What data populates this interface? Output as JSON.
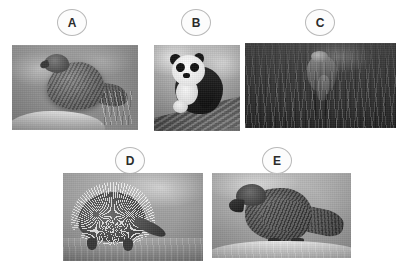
{
  "figure": {
    "background_color": "#ffffff",
    "width": 404,
    "height": 269,
    "label_outline_color": "#b9b9b9",
    "label_fill_color": "#fcfcfc",
    "label_text_color": "#2b2b2b"
  },
  "panels": [
    {
      "id": "a",
      "label": "A",
      "label_x": 57,
      "label_y": 9,
      "photo_x": 12,
      "photo_y": 45,
      "photo_w": 126,
      "photo_h": 85,
      "subject": "parrot-on-rock-photo",
      "description": "Grayscale photograph of a kea parrot perched on a rock with blurred foliage background"
    },
    {
      "id": "b",
      "label": "B",
      "label_x": 181,
      "label_y": 9,
      "photo_x": 154,
      "photo_y": 45,
      "photo_w": 86,
      "photo_h": 86,
      "subject": "giant-panda-photo",
      "description": "Grayscale photograph of a giant panda cub sitting on a fallen log"
    },
    {
      "id": "c",
      "label": "C",
      "label_x": 305,
      "label_y": 9,
      "photo_x": 245,
      "photo_y": 43,
      "photo_w": 151,
      "photo_h": 85,
      "subject": "dark-bird-in-grass-photo",
      "description": "Dark grayscale photograph of a flightless bird standing among tall grass"
    },
    {
      "id": "d",
      "label": "D",
      "label_x": 115,
      "label_y": 147,
      "photo_x": 63,
      "photo_y": 173,
      "photo_w": 140,
      "photo_h": 88,
      "subject": "echidna-photo",
      "description": "Grayscale photograph of a short-beaked echidna foraging on dry ground"
    },
    {
      "id": "e",
      "label": "E",
      "label_x": 262,
      "label_y": 147,
      "photo_x": 212,
      "photo_y": 173,
      "photo_w": 139,
      "photo_h": 85,
      "subject": "kea-parrot-photo",
      "description": "Grayscale photograph of a kea parrot perched on a pale rock in profile"
    }
  ]
}
